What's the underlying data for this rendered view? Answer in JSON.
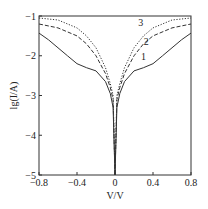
{
  "chart_data": {
    "type": "line",
    "title": "",
    "xlabel": "V/V",
    "ylabel": "lg(I/A)",
    "xlim": [
      -0.8,
      0.8
    ],
    "ylim": [
      -5,
      -1
    ],
    "xticks": [
      "-0.8",
      "-0.4",
      "0",
      "0.4",
      "0.8"
    ],
    "yticks": [
      "-1",
      "-2",
      "-3",
      "-4",
      "-5"
    ],
    "grid": false,
    "legend": "inline curve labels 1, 2, 3",
    "series": [
      {
        "name": "1",
        "style": "solid",
        "x": [
          -0.8,
          -0.7,
          -0.6,
          -0.5,
          -0.4,
          -0.3,
          -0.2,
          -0.1,
          -0.05,
          -0.02,
          0,
          0.02,
          0.05,
          0.1,
          0.2,
          0.3,
          0.4,
          0.5,
          0.6,
          0.7,
          0.8
        ],
        "y": [
          -1.43,
          -1.6,
          -1.8,
          -2.0,
          -2.2,
          -2.3,
          -2.38,
          -2.65,
          -2.95,
          -3.3,
          -5.0,
          -3.3,
          -2.95,
          -2.65,
          -2.38,
          -2.3,
          -2.2,
          -2.0,
          -1.8,
          -1.6,
          -1.43
        ]
      },
      {
        "name": "2",
        "style": "dashed",
        "x": [
          -0.8,
          -0.6,
          -0.4,
          -0.3,
          -0.2,
          -0.1,
          -0.05,
          -0.02,
          0,
          0.02,
          0.05,
          0.1,
          0.2,
          0.3,
          0.4,
          0.6,
          0.8
        ],
        "y": [
          -1.2,
          -1.3,
          -1.5,
          -1.7,
          -2.0,
          -2.45,
          -2.8,
          -3.1,
          -5.0,
          -3.1,
          -2.8,
          -2.45,
          -2.0,
          -1.7,
          -1.5,
          -1.3,
          -1.2
        ]
      },
      {
        "name": "3",
        "style": "dotted",
        "x": [
          -0.8,
          -0.6,
          -0.4,
          -0.3,
          -0.2,
          -0.1,
          -0.05,
          -0.02,
          0,
          0.02,
          0.05,
          0.1,
          0.2,
          0.3,
          0.4,
          0.6,
          0.8
        ],
        "y": [
          -1.05,
          -1.1,
          -1.3,
          -1.5,
          -1.8,
          -2.3,
          -2.7,
          -3.0,
          -5.0,
          -3.0,
          -2.7,
          -2.3,
          -1.8,
          -1.5,
          -1.3,
          -1.1,
          -1.05
        ]
      }
    ],
    "annotations": [
      {
        "text": "1",
        "x": 0.3,
        "y": -2.1
      },
      {
        "text": "2",
        "x": 0.33,
        "y": -1.72
      },
      {
        "text": "3",
        "x": 0.27,
        "y": -1.25
      }
    ]
  }
}
